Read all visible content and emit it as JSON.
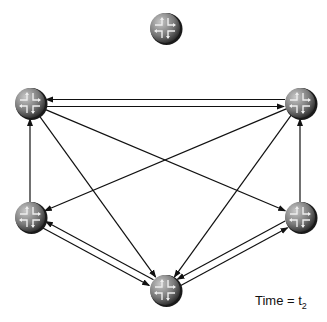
{
  "diagram": {
    "nodes": [
      {
        "id": "isolated",
        "x": 165,
        "y": 28,
        "icon": "router-icon"
      },
      {
        "id": "top-left",
        "x": 30,
        "y": 103,
        "icon": "router-icon"
      },
      {
        "id": "top-right",
        "x": 300,
        "y": 103,
        "icon": "router-icon"
      },
      {
        "id": "mid-left",
        "x": 30,
        "y": 217,
        "icon": "router-icon"
      },
      {
        "id": "mid-right",
        "x": 300,
        "y": 217,
        "icon": "router-icon"
      },
      {
        "id": "bottom",
        "x": 165,
        "y": 290,
        "icon": "router-icon"
      }
    ],
    "edges": [
      {
        "from": "top-left",
        "to": "top-right"
      },
      {
        "from": "top-right",
        "to": "top-left"
      },
      {
        "from": "mid-left",
        "to": "top-left"
      },
      {
        "from": "mid-right",
        "to": "top-right"
      },
      {
        "from": "top-left",
        "to": "mid-right"
      },
      {
        "from": "top-right",
        "to": "mid-left"
      },
      {
        "from": "top-left",
        "to": "bottom"
      },
      {
        "from": "top-right",
        "to": "bottom"
      },
      {
        "from": "mid-left",
        "to": "bottom"
      },
      {
        "from": "bottom",
        "to": "mid-left"
      },
      {
        "from": "mid-right",
        "to": "bottom"
      },
      {
        "from": "bottom",
        "to": "mid-right"
      }
    ],
    "caption": {
      "text": "Time = t",
      "subscript": "2"
    }
  }
}
